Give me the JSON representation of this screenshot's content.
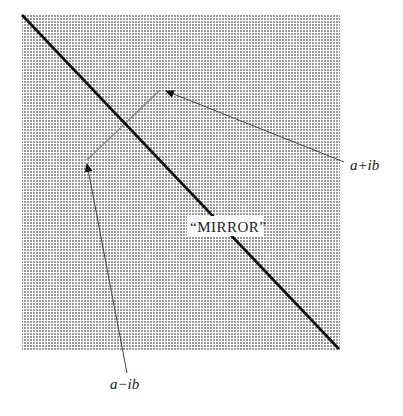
{
  "diagram": {
    "type": "complex-conjugate-reflection",
    "region": {
      "x": 22,
      "y": 15,
      "width": 318,
      "height": 335,
      "fill": "dotted-grey"
    },
    "mirror_line": {
      "x1": 22,
      "y1": 15,
      "x2": 339,
      "y2": 349,
      "label": "“MIRROR”"
    },
    "points": {
      "upper": {
        "label": "a+ib",
        "x": 165,
        "y": 91
      },
      "lower": {
        "label": "a−ib",
        "x": 87,
        "y": 164
      }
    },
    "colors": {
      "dots": "#9a9a9a",
      "line": "#111111",
      "arrow": "#333333",
      "connector": "#9a9a9a"
    }
  }
}
